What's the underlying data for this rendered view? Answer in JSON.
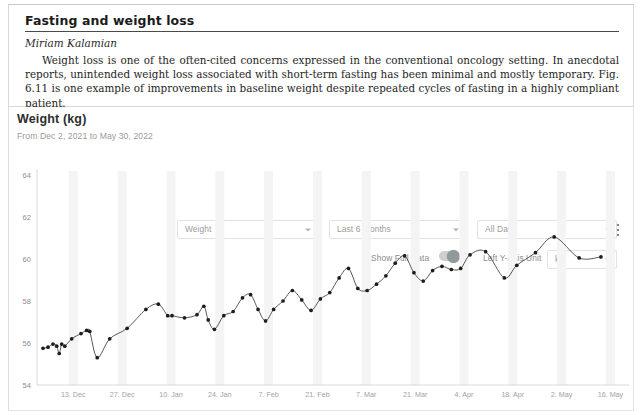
{
  "document": {
    "title": "Fasting and weight loss",
    "author": "Miriam Kalamian",
    "body": "Weight loss is one of the often-cited concerns expressed in the conventional oncology setting. In anecdotal reports, unintended weight loss associated with short-term fasting has been minimal and mostly temporary. Fig. 6.11 is one example of improvements in baseline weight despite repeated cycles of fasting in a highly compliant patient."
  },
  "app": {
    "header": {
      "title": "Weight (kg)",
      "subtitle": "From Dec 2, 2021 to May 30, 2022",
      "menu_icon": "kebab-menu-icon"
    },
    "controls": {
      "metric_select": {
        "value": "Weight",
        "icon": "chevron-down-icon"
      },
      "range_select": {
        "value": "Last 6 months",
        "icon": "chevron-down-icon"
      },
      "days_select": {
        "value": "All Days",
        "icon": "chevron-down-icon"
      },
      "show_full_data_label": "Show Full Data",
      "show_full_data_on": true,
      "y_axis_unit_label": "Left Y-Axis Unit",
      "unit_select": {
        "value": "kg",
        "icon": "chevron-down-icon"
      }
    }
  },
  "chart_data": {
    "type": "line",
    "title": "Weight (kg)",
    "subtitle": "From Dec 2, 2021 to May 30, 2022",
    "xlabel": "",
    "ylabel": "kg",
    "ylim": [
      54,
      64
    ],
    "yticks": [
      54,
      56,
      58,
      60,
      62,
      64
    ],
    "xticks": [
      "13. Dec",
      "27. Dec",
      "10. Jan",
      "24. Jan",
      "7. Feb",
      "21. Feb",
      "7. Mar",
      "21. Mar",
      "4. Apr",
      "18. Apr",
      "2. May",
      "16. May"
    ],
    "grid": false,
    "legend": "none",
    "accent_color": "#2e2e2e",
    "band_color": "#f4f4f4",
    "series": [
      {
        "name": "Weight",
        "unit": "kg",
        "x": [
          0.0,
          1.6,
          3.2,
          4.4,
          5.2,
          6.0,
          7.0,
          9.2,
          12.2,
          14.0,
          15.0,
          17.4,
          21.4,
          27.0,
          33.0,
          37.0,
          40.0,
          41.4,
          45.4,
          49.4,
          51.6,
          53.0,
          55.0,
          58.0,
          61.0,
          64.0,
          66.6,
          69.0,
          71.4,
          74.0,
          77.0,
          80.0,
          83.0,
          86.0,
          89.0,
          92.0,
          95.0,
          98.0,
          101.0,
          104.0,
          107.0,
          110.0,
          113.0,
          116.0,
          119.0,
          122.0,
          125.0,
          128.0,
          131.0,
          134.0,
          137.0,
          142.0,
          148.0,
          152.0,
          158.0,
          164.0,
          172.0,
          179.0
        ],
        "values": [
          55.75,
          55.8,
          55.95,
          55.85,
          55.5,
          55.95,
          55.85,
          56.2,
          56.45,
          56.6,
          56.55,
          55.3,
          56.2,
          56.7,
          57.6,
          57.85,
          57.3,
          57.3,
          57.2,
          57.35,
          57.75,
          57.1,
          56.65,
          57.3,
          57.5,
          58.15,
          58.3,
          57.6,
          57.05,
          57.6,
          58.0,
          58.5,
          58.05,
          57.55,
          58.1,
          58.4,
          59.1,
          59.55,
          58.6,
          58.5,
          58.8,
          59.2,
          59.8,
          60.15,
          59.35,
          58.95,
          59.45,
          59.65,
          59.5,
          59.55,
          60.2,
          60.35,
          59.1,
          59.7,
          60.3,
          61.05,
          60.05,
          60.1
        ]
      }
    ]
  }
}
